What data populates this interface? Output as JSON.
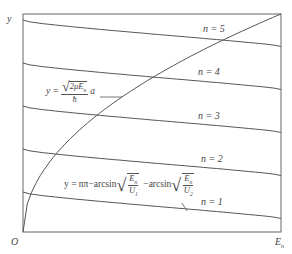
{
  "axes": {
    "y_label": "y",
    "x_label": "E",
    "x_label_sub": "n",
    "origin_label": "O"
  },
  "curves": {
    "levels": [
      {
        "n": 1,
        "label": "n = 1"
      },
      {
        "n": 2,
        "label": "n = 2"
      },
      {
        "n": 3,
        "label": "n = 3"
      },
      {
        "n": 4,
        "label": "n = 4"
      },
      {
        "n": 5,
        "label": "n = 5"
      }
    ],
    "sqrt_curve_label": "y = √(2μE_n)/ħ · a",
    "level_curve_label": "y = nπ − arcsin√(E_n/U_1) − arcsin√(E_n/U_2)"
  },
  "formula1": {
    "lhs": "y =",
    "num": "2μE",
    "num_sub": "n",
    "den": "ħ",
    "tail": "a"
  },
  "formula2": {
    "lhs": "y = nπ−arcsin",
    "num1": "E",
    "num1_sub": "n",
    "den1": "U",
    "den1_sub": "1",
    "mid": "−arcsin",
    "num2": "E",
    "num2_sub": "n",
    "den2": "U",
    "den2_sub": "2"
  },
  "colors": {
    "line": "#555555",
    "text": "#444444"
  }
}
